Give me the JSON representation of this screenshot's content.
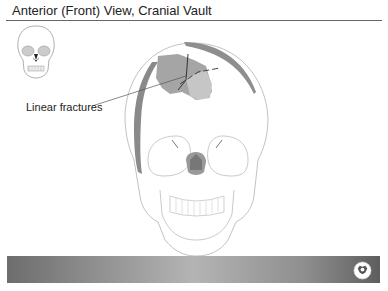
{
  "slide": {
    "title": "Anterior (Front) View, Cranial Vault",
    "annotation_label": "Linear fractures"
  },
  "illustrations": {
    "thumbnail": "skull-thumbnail-icon",
    "main": "anterior-skull-with-linear-fractures",
    "footer_logo": "publisher-logo-icon"
  },
  "colors": {
    "title_rule": "#666666",
    "fracture_shading": "#8a8a8a",
    "skull_outline": "#bbbbbb",
    "footer_dark": "#5e5e5e",
    "footer_light": "#b4b4b4"
  }
}
